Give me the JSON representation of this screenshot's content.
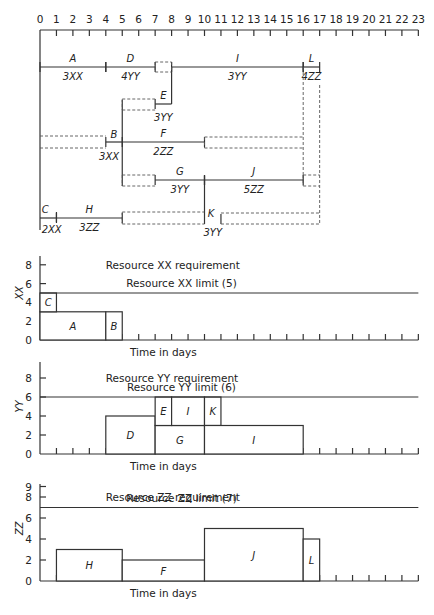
{
  "time_axis": {
    "ticks": [
      "0",
      "1",
      "2",
      "3",
      "4",
      "5",
      "6",
      "7",
      "8",
      "9",
      "10",
      "11",
      "12",
      "13",
      "14",
      "15",
      "16",
      "17",
      "18",
      "19",
      "20",
      "21",
      "22",
      "23"
    ]
  },
  "network": {
    "activities": [
      {
        "id": "A",
        "label": "A",
        "resource": "3XX",
        "start": 0,
        "end": 4,
        "row": "top"
      },
      {
        "id": "D",
        "label": "D",
        "resource": "4YY",
        "start": 4,
        "end": 7,
        "row": "top"
      },
      {
        "id": "I",
        "label": "I",
        "resource": "3YY",
        "start": 8,
        "end": 16,
        "row": "top"
      },
      {
        "id": "L",
        "label": "L",
        "resource": "4ZZ",
        "start": 16,
        "end": 17,
        "row": "top"
      },
      {
        "id": "E",
        "label": "E",
        "resource": "3YY",
        "start": 7,
        "end": 8,
        "row": "e"
      },
      {
        "id": "B",
        "label": "B",
        "resource": "3XX",
        "start": 4,
        "end": 5,
        "row": "bf"
      },
      {
        "id": "F",
        "label": "F",
        "resource": "2ZZ",
        "start": 5,
        "end": 10,
        "row": "bf"
      },
      {
        "id": "G",
        "label": "G",
        "resource": "3YY",
        "start": 7,
        "end": 10,
        "row": "gj"
      },
      {
        "id": "J",
        "label": "J",
        "resource": "5ZZ",
        "start": 10,
        "end": 16,
        "row": "gj"
      },
      {
        "id": "C",
        "label": "C",
        "resource": "2XX",
        "start": 0,
        "end": 1,
        "row": "ch"
      },
      {
        "id": "H",
        "label": "H",
        "resource": "3ZZ",
        "start": 1,
        "end": 5,
        "row": "ch"
      },
      {
        "id": "K",
        "label": "K",
        "resource": "3YY",
        "start": 10,
        "end": 11,
        "row": "k"
      }
    ]
  },
  "charts": {
    "xx": {
      "title": "Resource XX requirement",
      "limit_label": "Resource XX limit (5)",
      "ylabel": "XX",
      "xlabel": "Time in days",
      "yticks": [
        "0",
        "2",
        "4",
        "6",
        "8"
      ]
    },
    "yy": {
      "title": "Resource YY requirement",
      "limit_label": "Resource YY limit (6)",
      "ylabel": "YY",
      "xlabel": "Time in days",
      "yticks": [
        "0",
        "2",
        "4",
        "6",
        "8"
      ]
    },
    "zz": {
      "title": "Resource ZZ requirement",
      "limit_label": "Resource ZZ limit (7)",
      "ylabel": "ZZ",
      "xlabel": "Time in days",
      "yticks": [
        "0",
        "2",
        "4",
        "6",
        "8",
        "9"
      ]
    }
  },
  "chart_data": [
    {
      "type": "bar",
      "title": "Resource XX requirement",
      "xlabel": "Time in days",
      "ylabel": "XX",
      "ylim": [
        0,
        9
      ],
      "xlim": [
        0,
        23
      ],
      "limit": 5,
      "limit_label": "Resource XX limit (5)",
      "blocks": [
        {
          "activity": "A",
          "start": 0,
          "end": 4,
          "base": 0,
          "height": 3
        },
        {
          "activity": "C",
          "start": 0,
          "end": 1,
          "base": 3,
          "height": 2
        },
        {
          "activity": "B",
          "start": 4,
          "end": 5,
          "base": 0,
          "height": 3
        }
      ]
    },
    {
      "type": "bar",
      "title": "Resource YY requirement",
      "xlabel": "Time in days",
      "ylabel": "YY",
      "ylim": [
        0,
        9
      ],
      "xlim": [
        0,
        23
      ],
      "limit": 6,
      "limit_label": "Resource YY limit (6)",
      "blocks": [
        {
          "activity": "D",
          "start": 4,
          "end": 7,
          "base": 0,
          "height": 4
        },
        {
          "activity": "G",
          "start": 7,
          "end": 10,
          "base": 0,
          "height": 3
        },
        {
          "activity": "E",
          "start": 7,
          "end": 8,
          "base": 3,
          "height": 3
        },
        {
          "activity": "I",
          "start": 8,
          "end": 10,
          "base": 3,
          "height": 3
        },
        {
          "activity": "K",
          "start": 10,
          "end": 11,
          "base": 3,
          "height": 3
        },
        {
          "activity": "I",
          "start": 10,
          "end": 16,
          "base": 0,
          "height": 3
        }
      ]
    },
    {
      "type": "bar",
      "title": "Resource ZZ requirement",
      "xlabel": "Time in days",
      "ylabel": "ZZ",
      "ylim": [
        0,
        9
      ],
      "xlim": [
        0,
        23
      ],
      "limit": 7,
      "limit_label": "Resource ZZ limit (7)",
      "blocks": [
        {
          "activity": "H",
          "start": 1,
          "end": 5,
          "base": 0,
          "height": 3
        },
        {
          "activity": "F",
          "start": 5,
          "end": 10,
          "base": 0,
          "height": 2
        },
        {
          "activity": "J",
          "start": 10,
          "end": 16,
          "base": 0,
          "height": 5
        },
        {
          "activity": "L",
          "start": 16,
          "end": 17,
          "base": 0,
          "height": 4
        }
      ]
    }
  ]
}
